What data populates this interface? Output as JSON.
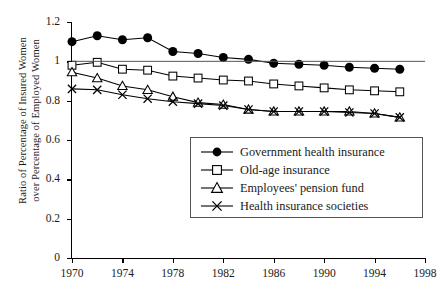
{
  "chart_data": {
    "type": "line",
    "title": "",
    "xlabel": "",
    "ylabel": "Ratio of Percentage of Insured Women\nover Percentage of Employed Women",
    "xlim": [
      1970,
      1998
    ],
    "ylim": [
      0,
      1.2
    ],
    "xticks": [
      1970,
      1974,
      1978,
      1982,
      1986,
      1990,
      1994,
      1998
    ],
    "yticks": [
      0,
      0.2,
      0.4,
      0.6,
      0.8,
      1,
      1.2
    ],
    "ytick_labels": [
      "0",
      "0.2",
      "0.4",
      "0.6",
      "0.8",
      "1",
      "1.2"
    ],
    "xtick_labels": [
      "1970",
      "1974",
      "1978",
      "1982",
      "1986",
      "1990",
      "1994",
      "1998"
    ],
    "grid": false,
    "legend_position": "center-right",
    "x": [
      1970,
      1972,
      1974,
      1976,
      1978,
      1980,
      1982,
      1984,
      1986,
      1988,
      1990,
      1992,
      1994,
      1996
    ],
    "series": [
      {
        "name": "Government health insurance",
        "marker": "filled-circle",
        "color": "#000000",
        "values": [
          1.1,
          1.13,
          1.11,
          1.12,
          1.05,
          1.04,
          1.02,
          1.01,
          0.99,
          0.985,
          0.98,
          0.97,
          0.965,
          0.96
        ]
      },
      {
        "name": "Old-age insurance",
        "marker": "open-square",
        "color": "#000000",
        "values": [
          0.98,
          0.995,
          0.96,
          0.955,
          0.925,
          0.915,
          0.905,
          0.9,
          0.885,
          0.875,
          0.865,
          0.855,
          0.85,
          0.845
        ]
      },
      {
        "name": "Employees' pension fund",
        "marker": "open-triangle",
        "color": "#000000",
        "values": [
          0.945,
          0.915,
          0.875,
          0.855,
          0.82,
          0.79,
          0.78,
          0.755,
          0.745,
          0.745,
          0.745,
          0.745,
          0.735,
          0.715
        ]
      },
      {
        "name": "Health insurance societies",
        "marker": "x-cross",
        "color": "#000000",
        "values": [
          0.86,
          0.855,
          0.83,
          0.81,
          0.795,
          0.785,
          0.775,
          0.755,
          0.745,
          0.745,
          0.745,
          0.74,
          0.735,
          0.715
        ]
      }
    ]
  },
  "legend": {
    "items": [
      {
        "label": "Government health insurance",
        "marker": "filled-circle"
      },
      {
        "label": "Old-age insurance",
        "marker": "open-square"
      },
      {
        "label": "Employees' pension fund",
        "marker": "open-triangle"
      },
      {
        "label": "Health insurance societies",
        "marker": "x-cross"
      }
    ]
  }
}
